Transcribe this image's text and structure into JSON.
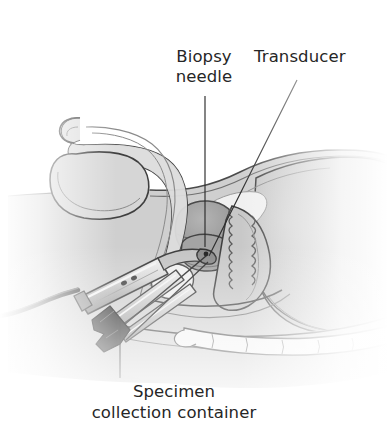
{
  "figure": {
    "kind": "medical-illustration",
    "view": "mid-sagittal cutaway, patient facing left",
    "style": "grayscale line-and-wash anatomical drawing",
    "background_color": "#ffffff"
  },
  "labels": {
    "biopsy_needle": "Biopsy\nneedle",
    "transducer": "Transducer",
    "specimen_collection_container": "Specimen\ncollection container"
  },
  "leaders": {
    "biopsy_needle": {
      "type": "straight-vertical",
      "from": [
        205,
        96
      ],
      "to": [
        205,
        245
      ]
    },
    "transducer": {
      "type": "straight-diagonal",
      "from": [
        297,
        80
      ],
      "to": [
        208,
        255
      ]
    },
    "specimen_collection_container": {
      "type": "straight-vertical",
      "from": [
        120,
        378
      ],
      "to": [
        120,
        318
      ]
    }
  },
  "anatomy": [
    {
      "name": "body-silhouette",
      "tone": "#cfcfcf"
    },
    {
      "name": "abdominal-wall",
      "tone": "#d6d6d6"
    },
    {
      "name": "urinary-bladder",
      "tone": "#9a9a9a"
    },
    {
      "name": "prostate-gland",
      "tone": "#a9a9a9"
    },
    {
      "name": "rectum",
      "tone": "#c4c4c4"
    },
    {
      "name": "penis",
      "tone": "#dcdcdc"
    },
    {
      "name": "scrotum-testis",
      "tone": "#d2d2d2"
    },
    {
      "name": "urethra",
      "tone": "#bdbdbd"
    },
    {
      "name": "pubic-bone",
      "tone": "#efefef"
    },
    {
      "name": "sacrum-coccyx",
      "tone": "#f2f2f2"
    },
    {
      "name": "gluteal-region",
      "tone": "#c8c8c8"
    },
    {
      "name": "thigh",
      "tone": "#d0d0d0"
    }
  ],
  "instruments": [
    {
      "name": "ultrasound-transducer-probe",
      "tone": "#bcbcbc",
      "note": "handheld endorectal probe with shaft inserted into rectum"
    },
    {
      "name": "transducer-cable",
      "tone": "#3a3a3a"
    },
    {
      "name": "biopsy-needle-guide",
      "tone": "#b4b4b4"
    },
    {
      "name": "specimen-collection-container",
      "tone": "#2e2e2e"
    }
  ],
  "colors": {
    "ink": "#262626",
    "line": "#3a3a3a",
    "line_soft": "#7d7d7d",
    "fill_body": "#cfcfcf",
    "fill_mid": "#bdbdbd",
    "fill_dark": "#9a9a9a",
    "fill_light": "#e6e6e6",
    "fill_bone": "#f2f2f2",
    "metal": "#c9c9c9",
    "metal_dark": "#8f8f8f",
    "container": "#2e2e2e",
    "background": "#ffffff"
  }
}
